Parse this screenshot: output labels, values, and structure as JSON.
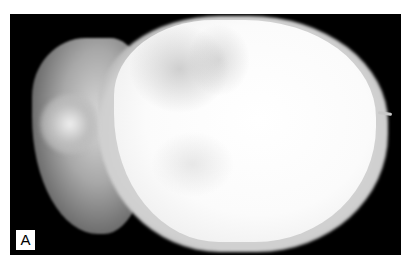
{
  "figure": {
    "panel_label": "A",
    "colors": {
      "background": "#000000",
      "specimen": "#f5f5f5",
      "page": "#ffffff"
    }
  }
}
